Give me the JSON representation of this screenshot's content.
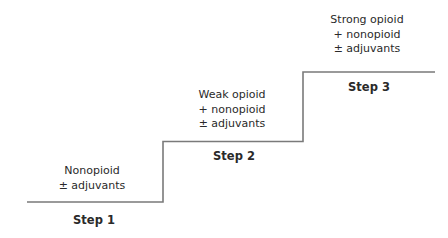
{
  "diagram": {
    "type": "staircase",
    "line_color": "#7a7a7a",
    "steps": [
      {
        "label": "Step 1",
        "lines": [
          "Nonopioid",
          "± adjuvants"
        ]
      },
      {
        "label": "Step 2",
        "lines": [
          "Weak opioid",
          "+ nonopioid",
          "± adjuvants"
        ]
      },
      {
        "label": "Step 3",
        "lines": [
          "Strong opioid",
          "+ nonopioid",
          "± adjuvants"
        ]
      }
    ]
  }
}
